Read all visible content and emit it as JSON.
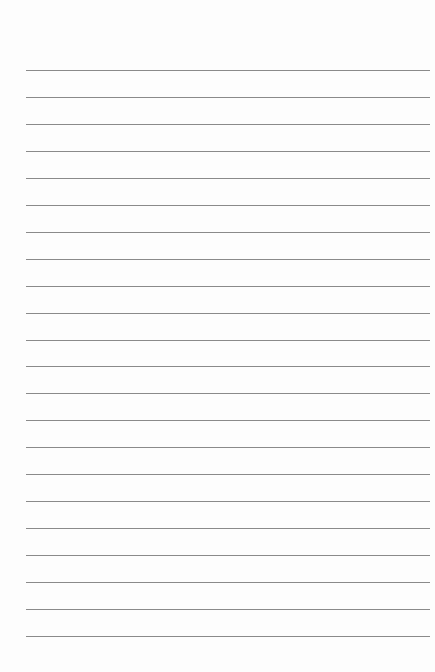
{
  "page": {
    "type": "lined-paper",
    "line_count": 22,
    "first_line_y": 70,
    "line_spacing": 26.95,
    "line_left": 26,
    "line_width": 404,
    "line_color": "#8a8a8a",
    "background_color": "#fdfdfd"
  }
}
